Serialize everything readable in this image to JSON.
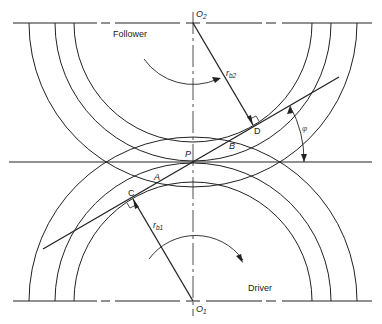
{
  "diagram": {
    "labels": {
      "follower": "Follower",
      "driver": "Driver",
      "o2": "O",
      "o2_sub": "2",
      "o1": "O",
      "o1_sub": "1",
      "rb2": "r",
      "rb2_sub": "b2",
      "rb1": "r",
      "rb1_sub": "b1",
      "p": "P",
      "a": "A",
      "b": "B",
      "c": "C",
      "d": "D",
      "phi": "φ"
    },
    "colors": {
      "line": "#222222",
      "background": "#ffffff"
    },
    "gears": [
      {
        "name": "follower",
        "center": "O2",
        "circles": [
          "base",
          "pitch",
          "addendum"
        ],
        "rotation": "clockwise"
      },
      {
        "name": "driver",
        "center": "O1",
        "circles": [
          "base",
          "pitch",
          "addendum"
        ],
        "rotation": "clockwise"
      }
    ]
  }
}
